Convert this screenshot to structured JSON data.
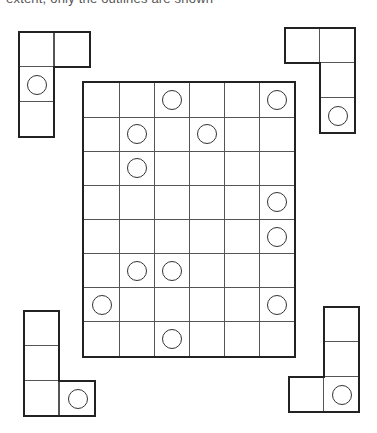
{
  "header": {
    "clipped_text": "extent, only the outlines are shown"
  },
  "grid": {
    "rows": 8,
    "cols": 6,
    "left": 82,
    "top": 81,
    "width": 214,
    "height": 277,
    "circles": [
      [
        0,
        2
      ],
      [
        0,
        5
      ],
      [
        1,
        1
      ],
      [
        1,
        3
      ],
      [
        2,
        1
      ],
      [
        3,
        5
      ],
      [
        4,
        5
      ],
      [
        5,
        1
      ],
      [
        5,
        2
      ],
      [
        6,
        0
      ],
      [
        6,
        5
      ],
      [
        7,
        2
      ]
    ]
  },
  "pieces": [
    {
      "name": "piece-top-left",
      "cell": 35,
      "cells": [
        [
          18,
          31,
          0
        ],
        [
          54,
          31,
          0
        ],
        [
          18,
          66,
          1
        ],
        [
          18,
          101,
          0
        ]
      ]
    },
    {
      "name": "piece-top-right",
      "cell": 35,
      "cells": [
        [
          284,
          27,
          0
        ],
        [
          319,
          27,
          0
        ],
        [
          319,
          62,
          0
        ],
        [
          319,
          97,
          1
        ]
      ]
    },
    {
      "name": "piece-bottom-left",
      "cell": 35,
      "cells": [
        [
          23,
          310,
          0
        ],
        [
          23,
          345,
          0
        ],
        [
          23,
          380,
          0
        ],
        [
          59,
          380,
          1
        ]
      ]
    },
    {
      "name": "piece-bottom-right",
      "cell": 35,
      "cells": [
        [
          323,
          306,
          0
        ],
        [
          323,
          341,
          0
        ],
        [
          288,
          376,
          0
        ],
        [
          323,
          376,
          1
        ]
      ]
    }
  ]
}
